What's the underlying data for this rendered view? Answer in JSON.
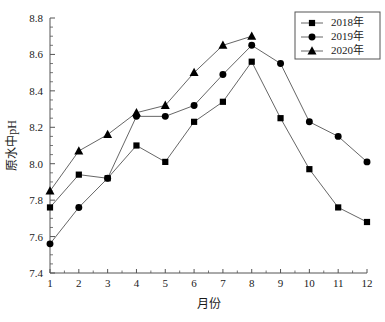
{
  "chart_data": {
    "type": "line",
    "title": "",
    "xlabel": "月份",
    "ylabel": "原水中pH",
    "categories": [
      "1",
      "2",
      "3",
      "4",
      "5",
      "6",
      "7",
      "8",
      "9",
      "10",
      "11",
      "12"
    ],
    "x": [
      1,
      2,
      3,
      4,
      5,
      6,
      7,
      8,
      9,
      10,
      11,
      12
    ],
    "xlim": [
      1,
      12
    ],
    "ylim": [
      7.4,
      8.8
    ],
    "y_ticks": [
      "7.4",
      "7.6",
      "7.8",
      "8.0",
      "8.2",
      "8.4",
      "8.6",
      "8.8"
    ],
    "y_tick_values": [
      7.4,
      7.6,
      7.8,
      8.0,
      8.2,
      8.4,
      8.6,
      8.8
    ],
    "y_tick_step": 0.2,
    "y_minor_step": 0.05,
    "grid": false,
    "legend_position": "top-right",
    "series": [
      {
        "name": "2018年",
        "marker": "square",
        "values": [
          7.76,
          7.94,
          7.92,
          8.1,
          8.01,
          8.23,
          8.34,
          8.56,
          8.25,
          7.97,
          7.76,
          7.68
        ]
      },
      {
        "name": "2019年",
        "marker": "circle",
        "values": [
          7.56,
          7.76,
          7.92,
          8.26,
          8.26,
          8.32,
          8.49,
          8.65,
          8.55,
          8.23,
          8.15,
          8.01
        ]
      },
      {
        "name": "2020年",
        "marker": "triangle",
        "values": [
          7.85,
          8.07,
          8.16,
          8.28,
          8.32,
          8.5,
          8.65,
          8.7,
          null,
          null,
          null,
          null
        ]
      }
    ]
  },
  "legend": {
    "items": [
      {
        "label": "2018年",
        "marker": "square"
      },
      {
        "label": "2019年",
        "marker": "circle"
      },
      {
        "label": "2020年",
        "marker": "triangle"
      }
    ]
  },
  "axes": {
    "x_title": "月份",
    "y_title": "原水中pH"
  }
}
